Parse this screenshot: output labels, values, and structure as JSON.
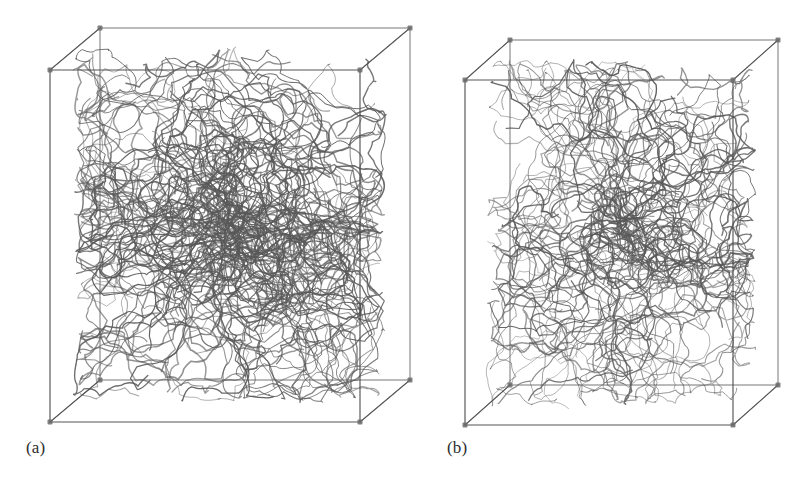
{
  "figure": {
    "type": "molecular-simulation-snapshot-pair",
    "background_color": "#ffffff",
    "line_color": "#4a4a4a",
    "dense_color": "#585858",
    "vertex_color": "#6b6b6b",
    "panels": [
      {
        "id": "a",
        "caption": "(a)",
        "description": "Cubic periodic simulation box filled with a dense entangled polymer chain network",
        "box": {
          "shape": "cube",
          "front_face": {
            "x1": 50,
            "y1": 70,
            "x2": 360,
            "y2": 422
          },
          "depth_offset_x": 50,
          "depth_offset_y": -42
        },
        "chain_count": 170,
        "chain_segments": 26,
        "core_density": 0.93,
        "core_radius_x": 0.4,
        "core_radius_y": 0.4,
        "seed": 1337
      },
      {
        "id": "b",
        "caption": "(b)",
        "description": "Elongated simulation box with a less dense, more open polymer chain network",
        "box": {
          "shape": "elongated-prism",
          "front_face": {
            "x1": 45,
            "y1": 80,
            "x2": 313,
            "y2": 425
          },
          "depth_offset_x": 45,
          "depth_offset_y": -40
        },
        "chain_count": 130,
        "chain_segments": 24,
        "core_density": 0.72,
        "core_radius_x": 0.4,
        "core_radius_y": 0.44,
        "seed": 90210
      }
    ]
  }
}
